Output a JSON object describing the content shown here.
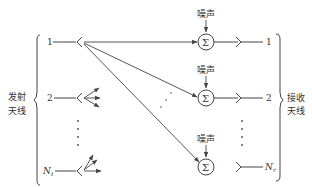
{
  "diagram": {
    "type": "MIMO channel block diagram",
    "transmit_group_label_line1": "发射",
    "transmit_group_label_line2": "天线",
    "receive_group_label_line1": "接收",
    "receive_group_label_line2": "天线",
    "transmit_antennas": [
      {
        "label": "1"
      },
      {
        "label": "2"
      },
      {
        "label": "N",
        "subscript": "t"
      }
    ],
    "receive_antennas": [
      {
        "label": "1"
      },
      {
        "label": "2"
      },
      {
        "label": "N",
        "subscript": "r"
      }
    ],
    "summing_nodes": [
      {
        "symbol": "Σ",
        "noise_label": "噪声"
      },
      {
        "symbol": "Σ",
        "noise_label": "噪声"
      },
      {
        "symbol": "Σ",
        "noise_label": "噪声"
      }
    ],
    "colors": {
      "line": "#444444",
      "text": "#333333",
      "background": "#ffffff"
    }
  }
}
